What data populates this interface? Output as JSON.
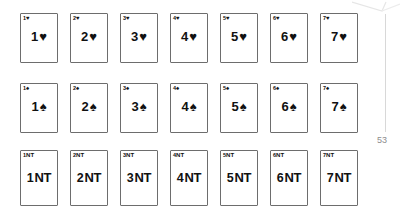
{
  "page": {
    "number": "53",
    "background_color": "#ffffff",
    "ink_color": "#111111",
    "card_border_color": "#6d6d6d",
    "scan_artifact_color": "#d8d8d8"
  },
  "rows": [
    {
      "name": "hearts",
      "suit_symbol": "♥",
      "suit_name": "hearts",
      "cards": [
        {
          "corner_level": "1",
          "corner_suit": "♥",
          "center_level": "1",
          "center_suit": "♥"
        },
        {
          "corner_level": "2",
          "corner_suit": "♥",
          "center_level": "2",
          "center_suit": "♥"
        },
        {
          "corner_level": "3",
          "corner_suit": "♥",
          "center_level": "3",
          "center_suit": "♥"
        },
        {
          "corner_level": "4",
          "corner_suit": "♥",
          "center_level": "4",
          "center_suit": "♥"
        },
        {
          "corner_level": "5",
          "corner_suit": "♥",
          "center_level": "5",
          "center_suit": "♥"
        },
        {
          "corner_level": "6",
          "corner_suit": "♥",
          "center_level": "6",
          "center_suit": "♥"
        },
        {
          "corner_level": "7",
          "corner_suit": "♥",
          "center_level": "7",
          "center_suit": "♥"
        }
      ]
    },
    {
      "name": "spades",
      "suit_symbol": "♠",
      "suit_name": "spades",
      "cards": [
        {
          "corner_level": "1",
          "corner_suit": "♠",
          "center_level": "1",
          "center_suit": "♠"
        },
        {
          "corner_level": "2",
          "corner_suit": "♠",
          "center_level": "2",
          "center_suit": "♠"
        },
        {
          "corner_level": "3",
          "corner_suit": "♠",
          "center_level": "3",
          "center_suit": "♠"
        },
        {
          "corner_level": "4",
          "corner_suit": "♠",
          "center_level": "4",
          "center_suit": "♠"
        },
        {
          "corner_level": "5",
          "corner_suit": "♠",
          "center_level": "5",
          "center_suit": "♠"
        },
        {
          "corner_level": "6",
          "corner_suit": "♠",
          "center_level": "6",
          "center_suit": "♠"
        },
        {
          "corner_level": "7",
          "corner_suit": "♠",
          "center_level": "7",
          "center_suit": "♠"
        }
      ]
    },
    {
      "name": "notrump",
      "suit_symbol": "NT",
      "suit_name": "no-trump",
      "cards": [
        {
          "corner_level": "1",
          "corner_suit": "NT",
          "center_level": "1",
          "center_suit": "NT"
        },
        {
          "corner_level": "2",
          "corner_suit": "NT",
          "center_level": "2",
          "center_suit": "NT"
        },
        {
          "corner_level": "3",
          "corner_suit": "NT",
          "center_level": "3",
          "center_suit": "NT"
        },
        {
          "corner_level": "4",
          "corner_suit": "NT",
          "center_level": "4",
          "center_suit": "NT"
        },
        {
          "corner_level": "5",
          "corner_suit": "NT",
          "center_level": "5",
          "center_suit": "NT"
        },
        {
          "corner_level": "6",
          "corner_suit": "NT",
          "center_level": "6",
          "center_suit": "NT"
        },
        {
          "corner_level": "7",
          "corner_suit": "NT",
          "center_level": "7",
          "center_suit": "NT"
        }
      ]
    }
  ]
}
